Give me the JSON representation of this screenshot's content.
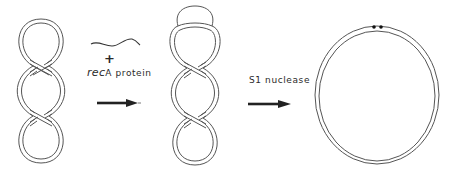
{
  "diagram": {
    "title": "",
    "colors": {
      "stroke": "#555555",
      "text": "#2a2a2a",
      "background": "#ffffff",
      "arrow": "#222222"
    },
    "nodes": [
      {
        "id": "supercoiled-dna",
        "label": "",
        "shape": "double-strand twisted circle (three loops)"
      },
      {
        "id": "d-loop-dna",
        "label": "",
        "shape": "double-strand twisted circle with displacement loop at top"
      },
      {
        "id": "nicked-relaxed-dna",
        "label": "",
        "shape": "relaxed double-strand circle with nicks"
      }
    ],
    "reagents": {
      "step1": {
        "plus": "+",
        "label_italic": "rec",
        "label_rest": "A protein",
        "ssdna_icon": "single-strand DNA wavy line"
      },
      "step2": {
        "label": "S1 nuclease"
      }
    },
    "edges": [
      {
        "from": "supercoiled-dna",
        "to": "d-loop-dna",
        "label": "+ recA protein"
      },
      {
        "from": "d-loop-dna",
        "to": "nicked-relaxed-dna",
        "label": "S1 nuclease"
      }
    ]
  }
}
